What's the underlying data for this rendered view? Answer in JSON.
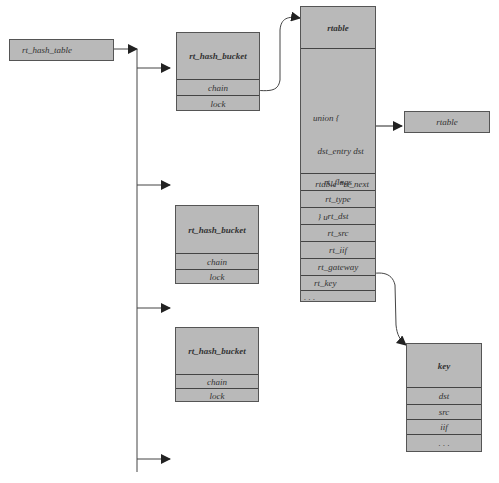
{
  "hash_table": {
    "label": "rt_hash_table"
  },
  "buckets": [
    {
      "title": "rt_hash_bucket",
      "fields": [
        "chain",
        "lock"
      ]
    },
    {
      "title": "rt_hash_bucket",
      "fields": [
        "chain",
        "lock"
      ]
    },
    {
      "title": "rt_hash_bucket",
      "fields": [
        "chain",
        "lock"
      ]
    }
  ],
  "rtable": {
    "title": "rtable",
    "union_lines": [
      "union {",
      "  dst_entry dst",
      " rtable *rt_next",
      "  } u"
    ],
    "fields": [
      "rt_flags",
      "rt_type",
      "rt_dst",
      "rt_src",
      "rt_iif",
      "rt_gateway",
      "rt_key",
      ". . ."
    ]
  },
  "next_rtable": {
    "label": "rtable"
  },
  "key": {
    "title": "key",
    "fields": [
      "dst",
      "src",
      "iif",
      ". . ."
    ]
  },
  "colors": {
    "box_fill": "#b9b9b9",
    "line": "#333333"
  }
}
